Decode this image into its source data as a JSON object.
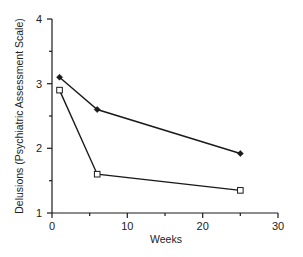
{
  "chart_data": {
    "type": "line",
    "title": "",
    "xlabel": "Weeks",
    "ylabel": "Delusions (Psychiatric Assessment Scale)",
    "xlim": [
      0,
      30
    ],
    "ylim": [
      1,
      4
    ],
    "x_ticks": [
      0,
      10,
      20,
      30
    ],
    "x_minor_ticks": [
      5,
      15,
      25
    ],
    "y_ticks": [
      1,
      2,
      3,
      4
    ],
    "y_minor_ticks": [
      1.5,
      2.5,
      3.5
    ],
    "grid": false,
    "legend": null,
    "series": [
      {
        "name": "Series A (filled diamond)",
        "marker": "diamond-filled",
        "x": [
          1,
          6,
          25
        ],
        "values": [
          3.1,
          2.6,
          1.92
        ]
      },
      {
        "name": "Series B (open square)",
        "marker": "square-open",
        "x": [
          1,
          6,
          25
        ],
        "values": [
          2.9,
          1.6,
          1.35
        ]
      }
    ]
  },
  "labels": {
    "x_title": "Weeks",
    "y_title": "Delusions (Psychiatric Assessment Scale)",
    "x_tick_0": "0",
    "x_tick_10": "10",
    "x_tick_20": "20",
    "x_tick_30": "30",
    "y_tick_1": "1",
    "y_tick_2": "2",
    "y_tick_3": "3",
    "y_tick_4": "4"
  },
  "colors": {
    "line": "#1a1a1a",
    "axis": "#1a1a1a",
    "background": "#ffffff"
  }
}
